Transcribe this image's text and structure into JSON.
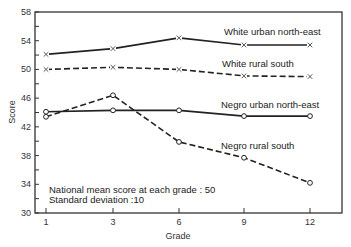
{
  "chart_data": {
    "type": "line",
    "title": "",
    "xlabel": "Grade",
    "ylabel": "Score",
    "categories": [
      "1",
      "3",
      "6",
      "9",
      "12"
    ],
    "ylim": [
      30,
      58
    ],
    "yticks": [
      30,
      34,
      38,
      42,
      46,
      50,
      54,
      58
    ],
    "y_minor_step": 2,
    "grid": false,
    "legend": "inline labels next to lines",
    "series": [
      {
        "name": "White urban north-east",
        "values": [
          52.1,
          52.9,
          54.4,
          53.4,
          53.4
        ],
        "line": "solid",
        "marker": "x"
      },
      {
        "name": "White rural south",
        "values": [
          50.0,
          50.3,
          50.0,
          49.1,
          49.0
        ],
        "line": "dashed",
        "marker": "x"
      },
      {
        "name": "Negro urban north-east",
        "values": [
          44.1,
          44.3,
          44.3,
          43.5,
          43.5
        ],
        "line": "solid",
        "marker": "o"
      },
      {
        "name": "Negro rural south",
        "values": [
          43.4,
          46.4,
          39.9,
          37.7,
          34.2
        ],
        "line": "dashed",
        "marker": "o"
      }
    ],
    "annotations": [
      "National mean score at each grade : 50",
      "Standard deviation :10"
    ]
  }
}
